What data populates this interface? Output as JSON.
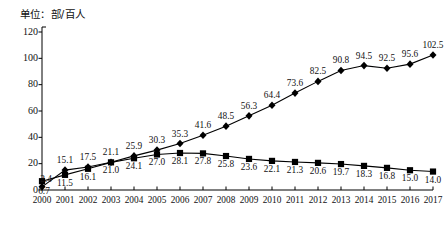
{
  "unit_label": "单位：部/百人",
  "chart_data": {
    "type": "line",
    "title": "",
    "subtitle": "",
    "xlabel": "",
    "ylabel": "单位：部/百人",
    "grid": false,
    "legend": "none",
    "ylim": [
      0,
      120
    ],
    "ytick_labels": [
      "0",
      "20",
      "40",
      "60",
      "80",
      "100",
      "120"
    ],
    "yticks": [
      0,
      20,
      40,
      60,
      80,
      100,
      120
    ],
    "categories": [
      "2000",
      "2001",
      "2002",
      "2003",
      "2004",
      "2005",
      "2006",
      "2007",
      "2008",
      "2009",
      "2010",
      "2011",
      "2012",
      "2013",
      "2014",
      "2015",
      "2016",
      "2017"
    ],
    "x": [
      2000,
      2001,
      2002,
      2003,
      2004,
      2005,
      2006,
      2007,
      2008,
      2009,
      2010,
      2011,
      2012,
      2013,
      2014,
      2015,
      2016,
      2017
    ],
    "series": [
      {
        "name": "fixed-line",
        "marker": "diamond",
        "label_position": "above",
        "values": [
          2.4,
          15.1,
          17.5,
          21.1,
          25.9,
          30.3,
          35.3,
          41.6,
          48.5,
          56.3,
          64.4,
          73.6,
          82.5,
          90.8,
          94.5,
          92.5,
          95.6,
          102.5
        ]
      },
      {
        "name": "mobile",
        "marker": "square",
        "label_position": "below",
        "values": [
          6.7,
          11.5,
          16.1,
          21.0,
          24.1,
          27.0,
          28.1,
          27.8,
          25.8,
          23.6,
          22.1,
          21.3,
          20.6,
          19.7,
          18.3,
          16.8,
          15.0,
          14.0
        ]
      }
    ],
    "colors": {
      "line": "#000000",
      "marker": "#000000",
      "axis": "#000000",
      "text": "#111111"
    }
  }
}
